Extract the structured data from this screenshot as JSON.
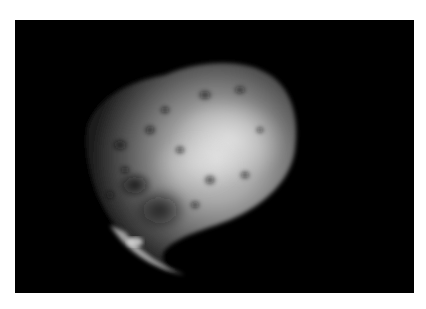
{
  "image": {
    "subject": "asteroid-like rocky body with craters on black space background",
    "colors": {
      "border": "#ffffff",
      "background": "#000000",
      "highlight": "#d8d8d8",
      "midtone": "#7a7a7a",
      "shadow": "#1e1e1e"
    }
  }
}
